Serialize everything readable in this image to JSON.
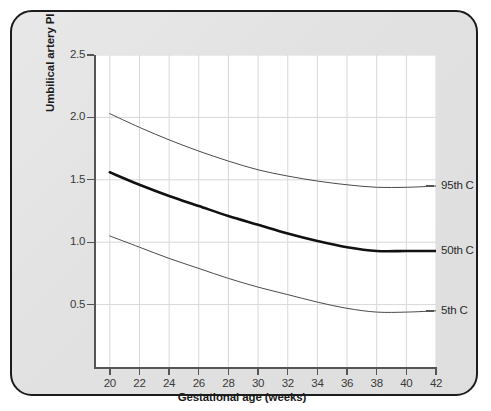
{
  "figure": {
    "frame_border_color": "#1c1c1c",
    "frame_background_color": "#e4e4e4",
    "plot_background_color": "#ffffff",
    "grid_color": "#d8d8d8",
    "axis_color": "#555555"
  },
  "chart_data": {
    "type": "line",
    "title": "",
    "subtitle": "",
    "xlabel": "Gestational age (weeks)",
    "ylabel": "Umbilical artery PI",
    "xlim": [
      19,
      42
    ],
    "ylim": [
      0,
      2.5
    ],
    "xticks": [
      20,
      22,
      24,
      26,
      28,
      30,
      32,
      34,
      36,
      38,
      40,
      42
    ],
    "xtick_labels": [
      "20",
      "22",
      "24",
      "26",
      "28",
      "30",
      "32",
      "34",
      "36",
      "38",
      "40",
      "42"
    ],
    "yticks": [
      0.5,
      1.0,
      1.5,
      2.0,
      2.5
    ],
    "ytick_labels": [
      "0.5",
      "1.0",
      "1.5",
      "2.0",
      "2.5"
    ],
    "grid": true,
    "grid_axes": "both",
    "legend_position": "right-of-axes-inline",
    "x": [
      20,
      22,
      24,
      26,
      28,
      30,
      32,
      34,
      36,
      38,
      40,
      42
    ],
    "series": [
      {
        "name": "95th C",
        "label": "95th C",
        "color": "#4a4a4a",
        "linewidth": 1.0,
        "values": [
          2.03,
          1.92,
          1.82,
          1.73,
          1.65,
          1.58,
          1.53,
          1.49,
          1.46,
          1.44,
          1.44,
          1.45
        ]
      },
      {
        "name": "50th C",
        "label": "50th C",
        "color": "#111111",
        "linewidth": 2.6,
        "values": [
          1.56,
          1.46,
          1.37,
          1.29,
          1.21,
          1.14,
          1.07,
          1.01,
          0.96,
          0.93,
          0.93,
          0.93
        ]
      },
      {
        "name": "5th C",
        "label": "5th C",
        "color": "#4a4a4a",
        "linewidth": 1.0,
        "values": [
          1.05,
          0.96,
          0.87,
          0.79,
          0.71,
          0.64,
          0.58,
          0.52,
          0.47,
          0.44,
          0.44,
          0.45
        ]
      }
    ],
    "series_labels": [
      {
        "text": "95th C",
        "at_x": 42,
        "at_y": 1.45
      },
      {
        "text": "50th C",
        "at_x": 42,
        "at_y": 0.93
      },
      {
        "text": "5th C",
        "at_x": 42,
        "at_y": 0.45
      }
    ]
  }
}
